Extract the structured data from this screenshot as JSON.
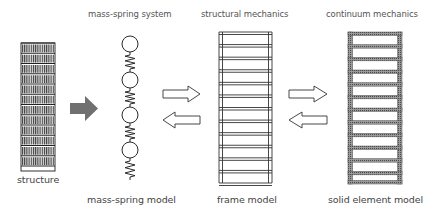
{
  "labels": {
    "structure": "structure",
    "mass_spring_system": "mass-spring system",
    "structural_mechanics": "structural mechanics",
    "continuum_mechanics": "continuum mechanics",
    "mass_spring_model": "mass-spring model",
    "frame_model": "frame model",
    "solid_element_model": "solid element model"
  },
  "diagram": {
    "nodes": [
      {
        "id": "structure",
        "label": "structure"
      },
      {
        "id": "mass-spring",
        "label": "mass-spring model",
        "category": "mass-spring system",
        "masses": 4,
        "springs": 4
      },
      {
        "id": "frame",
        "label": "frame model",
        "category": "structural mechanics",
        "stories": 12
      },
      {
        "id": "solid",
        "label": "solid element model",
        "category": "continuum mechanics",
        "stories": 12
      }
    ],
    "edges": [
      {
        "from": "structure",
        "to": "mass-spring",
        "style": "filled-arrow"
      },
      {
        "from": "mass-spring",
        "to": "frame",
        "style": "outline-arrow"
      },
      {
        "from": "frame",
        "to": "mass-spring",
        "style": "outline-arrow"
      },
      {
        "from": "frame",
        "to": "solid",
        "style": "outline-arrow"
      },
      {
        "from": "solid",
        "to": "frame",
        "style": "outline-arrow"
      }
    ],
    "colors": {
      "filled_arrow": "#707070",
      "line": "#333333"
    }
  }
}
